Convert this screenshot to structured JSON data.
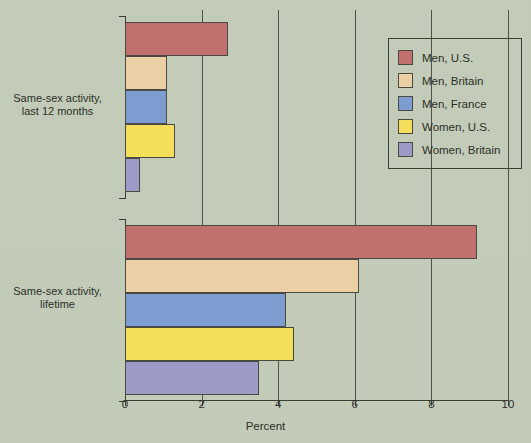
{
  "chart_data": {
    "type": "bar",
    "orientation": "horizontal",
    "title": "",
    "xlabel": "Percent",
    "ylabel": "",
    "xlim": [
      0,
      10
    ],
    "xticks": [
      0,
      2,
      4,
      6,
      8,
      10
    ],
    "xtick_labels": [
      "0",
      "2",
      "4",
      "6",
      "8",
      "10"
    ],
    "grid": "vertical",
    "legend_position": "upper right",
    "categories": [
      "Same-sex activity, last 12 months",
      "Same-sex activity, lifetime"
    ],
    "category_lines": [
      [
        "Same-sex activity,",
        "last 12 months"
      ],
      [
        "Same-sex activity,",
        "lifetime"
      ]
    ],
    "series": [
      {
        "name": "Men, U.S.",
        "color": "#c1706d",
        "values": [
          2.7,
          9.2
        ]
      },
      {
        "name": "Men, Britain",
        "color": "#edcfa5",
        "values": [
          1.1,
          6.1
        ]
      },
      {
        "name": "Men, France",
        "color": "#7d9dd0",
        "values": [
          1.1,
          4.2
        ]
      },
      {
        "name": "Women, U.S.",
        "color": "#f5de5a",
        "values": [
          1.3,
          4.4
        ]
      },
      {
        "name": "Women, Britain",
        "color": "#9e9ac8",
        "values": [
          0.4,
          3.5
        ]
      }
    ]
  },
  "colors": {
    "background": "#c4cdb9",
    "axis": "#3a3f35",
    "gridline": "#4d5347",
    "text": "#2c2f28",
    "bar_border": "#4a4a42"
  }
}
